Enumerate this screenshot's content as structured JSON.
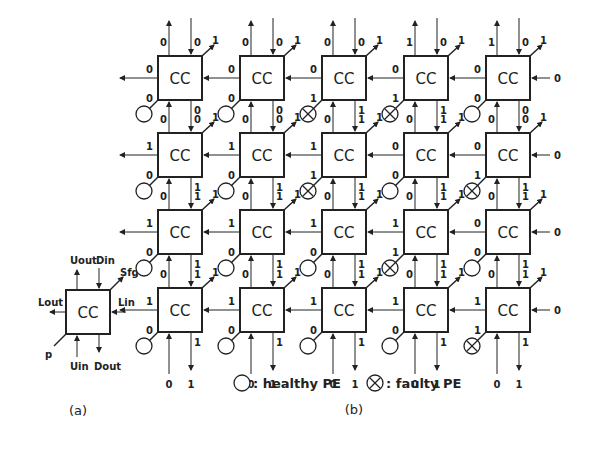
{
  "figure_a": {
    "box_label": "CC",
    "ports": {
      "u_out": "Uout",
      "d_in": "Din",
      "s_fg": "Sfg",
      "l_out": "Lout",
      "l_in": "Lin",
      "p": "p",
      "u_in": "Uin",
      "d_out": "Dout"
    },
    "caption": "(a)"
  },
  "figure_b": {
    "box_label": "CC",
    "caption": "(b)",
    "legend": {
      "healthy": ": healthy PE",
      "faulty": ": faulty PE"
    },
    "grid": [
      [
        {
          "pe": "healthy",
          "p": "0",
          "lout": "0",
          "uout": "0",
          "din": "0",
          "sfg": "1",
          "dout": "0"
        },
        {
          "pe": "healthy",
          "p": "0",
          "lout": "0",
          "uout": "0",
          "din": "0",
          "sfg": "1",
          "dout": "0"
        },
        {
          "pe": "faulty",
          "p": "1",
          "lout": "0",
          "uout": "0",
          "din": "0",
          "sfg": "1",
          "dout": "1"
        },
        {
          "pe": "faulty",
          "p": "1",
          "lout": "0",
          "uout": "1",
          "din": "0",
          "sfg": "1",
          "dout": "1"
        },
        {
          "pe": "healthy",
          "p": "0",
          "lout": "0",
          "uout": "1",
          "din": "0",
          "sfg": "1",
          "dout": "0",
          "lin": "0"
        }
      ],
      [
        {
          "pe": "healthy",
          "p": "0",
          "lout": "1",
          "uout": "0",
          "din": "0",
          "sfg": "1",
          "dout": "1"
        },
        {
          "pe": "healthy",
          "p": "0",
          "lout": "1",
          "uout": "0",
          "din": "0",
          "sfg": "1",
          "dout": "1"
        },
        {
          "pe": "faulty",
          "p": "1",
          "lout": "1",
          "uout": "0",
          "din": "1",
          "sfg": "1",
          "dout": "1"
        },
        {
          "pe": "healthy",
          "p": "0",
          "lout": "0",
          "uout": "0",
          "din": "1",
          "sfg": "1",
          "dout": "1"
        },
        {
          "pe": "faulty",
          "p": "1",
          "lout": "0",
          "uout": "0",
          "din": "0",
          "sfg": "1",
          "dout": "1",
          "lin": "0"
        }
      ],
      [
        {
          "pe": "healthy",
          "p": "0",
          "lout": "1",
          "uout": "0",
          "din": "1",
          "sfg": "1",
          "dout": "1"
        },
        {
          "pe": "healthy",
          "p": "0",
          "lout": "1",
          "uout": "0",
          "din": "1",
          "sfg": "1",
          "dout": "1"
        },
        {
          "pe": "healthy",
          "p": "0",
          "lout": "1",
          "uout": "0",
          "din": "1",
          "sfg": "1",
          "dout": "1"
        },
        {
          "pe": "faulty",
          "p": "1",
          "lout": "1",
          "uout": "0",
          "din": "1",
          "sfg": "1",
          "dout": "1"
        },
        {
          "pe": "healthy",
          "p": "0",
          "lout": "0",
          "uout": "0",
          "din": "1",
          "sfg": "1",
          "dout": "1",
          "lin": "0"
        }
      ],
      [
        {
          "pe": "healthy",
          "p": "0",
          "lout": "1",
          "uout": "0",
          "din": "1",
          "sfg": "1",
          "uin": "0",
          "dout": "1"
        },
        {
          "pe": "healthy",
          "p": "0",
          "lout": "1",
          "uout": "0",
          "din": "1",
          "sfg": "1",
          "uin": "0",
          "dout": "1"
        },
        {
          "pe": "healthy",
          "p": "0",
          "lout": "1",
          "uout": "0",
          "din": "1",
          "sfg": "1",
          "uin": "0",
          "dout": "1"
        },
        {
          "pe": "healthy",
          "p": "0",
          "lout": "1",
          "uout": "0",
          "din": "1",
          "sfg": "1",
          "uin": "0",
          "dout": "1"
        },
        {
          "pe": "faulty",
          "p": "1",
          "lout": "1",
          "uout": "0",
          "din": "1",
          "sfg": "1",
          "uin": "0",
          "dout": "1",
          "lin": "0"
        }
      ]
    ]
  }
}
